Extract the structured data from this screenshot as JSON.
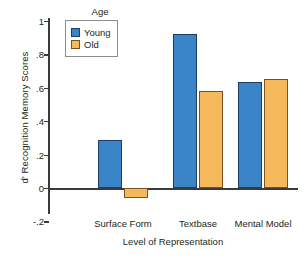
{
  "chart_data": {
    "type": "bar",
    "title": "",
    "xlabel": "Level of Representation",
    "ylabel": "d' Recognition Memory Scores",
    "categories": [
      "Surface Form",
      "Textbase",
      "Mental Model"
    ],
    "series": [
      {
        "name": "Young",
        "color": "#3a85c8",
        "values": [
          0.29,
          0.92,
          0.635
        ]
      },
      {
        "name": "Old",
        "color": "#f5b95b",
        "values": [
          -0.06,
          0.58,
          0.655
        ]
      }
    ],
    "ylim": [
      -0.2,
      1.05
    ],
    "yticks": [
      1,
      0.8,
      0.6,
      0.4,
      0.2,
      0,
      -0.2
    ],
    "ytick_labels": [
      "1",
      ".8",
      ".6",
      ".4",
      ".2",
      "0",
      "-.2"
    ],
    "grid": false,
    "legend": {
      "title": "Age",
      "position": "upper-left",
      "entries": [
        "Young",
        "Old"
      ]
    }
  },
  "legend": {
    "title": "Age",
    "entries": [
      {
        "label": "Young"
      },
      {
        "label": "Old"
      }
    ]
  },
  "axes": {
    "y_title": "d' Recognition Memory Scores",
    "x_title": "Level of Representation",
    "y_tick_labels": [
      "1",
      ".8",
      ".6",
      ".4",
      ".2",
      "0",
      "-.2"
    ],
    "x_tick_labels": [
      "Surface Form",
      "Textbase",
      "Mental Model"
    ]
  }
}
